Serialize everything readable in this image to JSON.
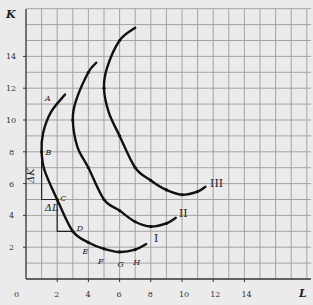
{
  "chart_data": {
    "type": "line",
    "title": "",
    "xlabel": "L",
    "ylabel": "K",
    "xlim": [
      0,
      18
    ],
    "ylim": [
      0,
      17
    ],
    "grid": true,
    "x_ticks": [
      "0",
      "2",
      "4",
      "6",
      "8",
      "10",
      "12",
      "14"
    ],
    "y_ticks": [
      "2",
      "4",
      "6",
      "8",
      "10",
      "12",
      "14"
    ],
    "series": [
      {
        "name": "I",
        "points": [
          [
            2.5,
            11.6
          ],
          [
            1.6,
            10.5
          ],
          [
            1.1,
            9.2
          ],
          [
            1,
            8
          ],
          [
            1.2,
            6.8
          ],
          [
            2,
            5
          ],
          [
            3,
            3
          ],
          [
            4,
            2.3
          ],
          [
            5,
            1.9
          ],
          [
            6,
            1.7
          ],
          [
            7,
            1.85
          ],
          [
            7.7,
            2.2
          ]
        ],
        "labeled_points": [
          {
            "label": "A",
            "x": 2.5,
            "y": 11.6
          },
          {
            "label": "B",
            "x": 1,
            "y": 8
          },
          {
            "label": "C",
            "x": 2,
            "y": 5
          },
          {
            "label": "D",
            "x": 3,
            "y": 3
          },
          {
            "label": "E",
            "x": 4,
            "y": 2.3
          },
          {
            "label": "F",
            "x": 5,
            "y": 1.9
          },
          {
            "label": "G",
            "x": 6,
            "y": 1.7
          },
          {
            "label": "H",
            "x": 7,
            "y": 1.85
          }
        ]
      },
      {
        "name": "II",
        "points": [
          [
            4.5,
            13.6
          ],
          [
            4,
            13
          ],
          [
            3.2,
            11.2
          ],
          [
            3,
            10
          ],
          [
            3.3,
            8.3
          ],
          [
            4,
            7
          ],
          [
            5,
            5
          ],
          [
            6,
            4.3
          ],
          [
            7,
            3.6
          ],
          [
            8,
            3.3
          ],
          [
            9,
            3.5
          ],
          [
            9.6,
            3.85
          ]
        ]
      },
      {
        "name": "III",
        "points": [
          [
            7,
            15.8
          ],
          [
            6,
            15
          ],
          [
            5.2,
            13.3
          ],
          [
            5,
            12
          ],
          [
            5.3,
            10.5
          ],
          [
            6,
            9
          ],
          [
            7,
            7
          ],
          [
            8,
            6.2
          ],
          [
            9,
            5.6
          ],
          [
            10,
            5.3
          ],
          [
            11,
            5.5
          ],
          [
            11.5,
            5.8
          ]
        ]
      }
    ],
    "annotations": [
      {
        "text": "ΔK",
        "x": 0.5,
        "y": 6.5,
        "rotation": -90
      },
      {
        "text": "ΔL",
        "x": 1.2,
        "y": 4.3
      },
      {
        "text": "I",
        "x": 8.2,
        "y": 2.3
      },
      {
        "text": "II",
        "x": 9.8,
        "y": 3.9
      },
      {
        "text": "III",
        "x": 11.8,
        "y": 5.8
      }
    ],
    "step_lines": [
      [
        [
          1,
          8
        ],
        [
          1,
          5
        ],
        [
          2,
          5
        ]
      ],
      [
        [
          2,
          5
        ],
        [
          2,
          3
        ],
        [
          3,
          3
        ]
      ]
    ]
  }
}
